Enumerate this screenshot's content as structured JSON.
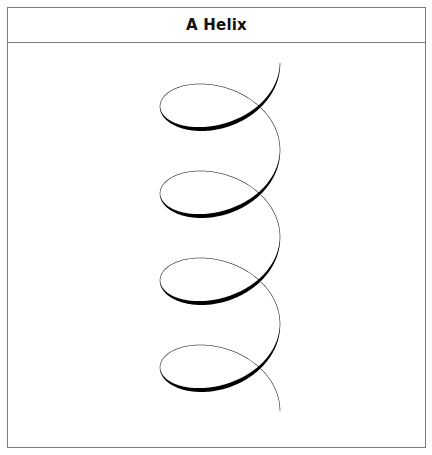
{
  "figure": {
    "title": "A Helix"
  },
  "colors": {
    "frame": "#7a7a7a",
    "stroke": "#000000",
    "background": "#ffffff"
  },
  "chart_data": {
    "type": "line",
    "title": "A Helix",
    "turns": 4,
    "center_x": 220,
    "radius_x": 60,
    "radius_y": 42,
    "start_y": 63,
    "pitch": 87,
    "min_width": 0.5,
    "max_width": 4.2,
    "start_point": [
      280,
      63
    ],
    "end_point": [
      282,
      411
    ]
  }
}
